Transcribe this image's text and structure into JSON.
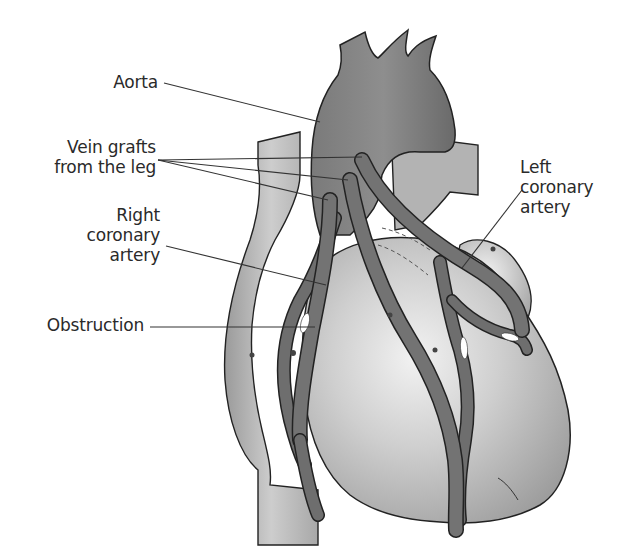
{
  "diagram": {
    "labels": {
      "aorta": "Aorta",
      "vein_grafts": "Vein grafts\nfrom the leg",
      "right_coronary": "Right\ncoronary\nartery",
      "obstruction": "Obstruction",
      "left_coronary": "Left\ncoronary\nartery"
    },
    "colors": {
      "background": "#ffffff",
      "heart_fill": "#c8c8c8",
      "heart_highlight": "#ececec",
      "vessel_fill": "#6e6e6e",
      "aorta_fill": "#8a8a8a",
      "outline": "#222222",
      "obstruction_fill": "#ffffff",
      "label_text": "#2a2a2a"
    }
  }
}
